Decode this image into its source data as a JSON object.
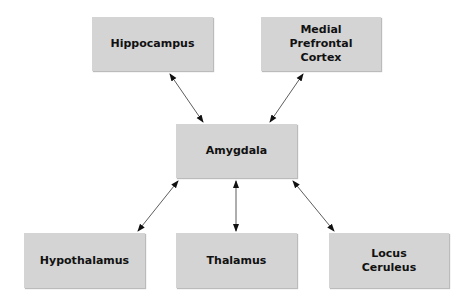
{
  "diagram": {
    "type": "hub-and-spoke",
    "center": "Amygdala",
    "nodes": [
      {
        "id": "hippocampus",
        "label": "Hippocampus",
        "x": 92,
        "y": 17,
        "w": 121,
        "h": 54
      },
      {
        "id": "mpfc",
        "label": "Medial\nPrefrontal\nCortex",
        "x": 261,
        "y": 17,
        "w": 120,
        "h": 54
      },
      {
        "id": "amygdala",
        "label": "Amygdala",
        "x": 176,
        "y": 124,
        "w": 121,
        "h": 54
      },
      {
        "id": "hypothalamus",
        "label": "Hypothalamus",
        "x": 24,
        "y": 233,
        "w": 121,
        "h": 55
      },
      {
        "id": "thalamus",
        "label": "Thalamus",
        "x": 176,
        "y": 233,
        "w": 121,
        "h": 55
      },
      {
        "id": "locus",
        "label": "Locus\nCeruleus",
        "x": 329,
        "y": 233,
        "w": 120,
        "h": 55
      }
    ],
    "edges": [
      {
        "from": "amygdala",
        "to": "hippocampus",
        "bidirectional": true
      },
      {
        "from": "amygdala",
        "to": "mpfc",
        "bidirectional": true
      },
      {
        "from": "amygdala",
        "to": "hypothalamus",
        "bidirectional": true
      },
      {
        "from": "amygdala",
        "to": "thalamus",
        "bidirectional": true
      },
      {
        "from": "amygdala",
        "to": "locus",
        "bidirectional": true
      }
    ]
  }
}
